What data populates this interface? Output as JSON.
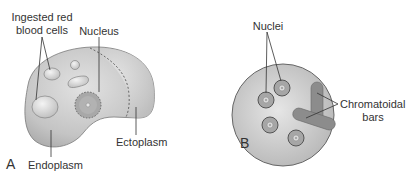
{
  "figure": {
    "panel_a": {
      "letter": "A",
      "labels": {
        "ingested_line1": "Ingested red",
        "ingested_line2": "blood cells",
        "nucleus": "Nucleus",
        "ectoplasm": "Ectoplasm",
        "endoplasm": "Endoplasm"
      }
    },
    "panel_b": {
      "letter": "B",
      "labels": {
        "nuclei": "Nuclei",
        "chromatoidal_line1": "Chromatoidal",
        "chromatoidal_line2": "bars"
      }
    },
    "colors": {
      "cell_fill": "#c8c8c8",
      "cell_stroke": "#555555",
      "organelle_fill": "#dcdcdc",
      "bar_fill": "#8c8c8c",
      "text": "#333333"
    }
  }
}
